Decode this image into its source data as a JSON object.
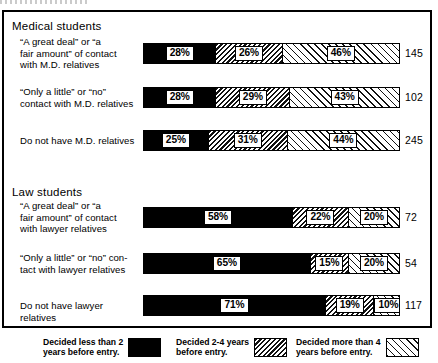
{
  "chart_data": {
    "type": "bar",
    "subtype": "stacked-horizontal-percent",
    "title": "",
    "xlabel": "",
    "ylabel": "",
    "xlim": [
      0,
      100
    ],
    "grid": false,
    "legend_position": "bottom",
    "series": [
      {
        "name": "Decided less than 2 years before entry.",
        "key": "s0",
        "pattern": "solid-black"
      },
      {
        "name": "Decided 2-4 years before entry.",
        "key": "s1",
        "pattern": "dense-diagonal-hatch"
      },
      {
        "name": "Decided more than 4 years before entry.",
        "key": "s2",
        "pattern": "sparse-diagonal-hatch"
      }
    ],
    "groups": [
      {
        "heading": "Medical students",
        "rows": [
          {
            "label": "“A great deal” or “a\nfair amount” of contact\nwith M.D. relatives",
            "values": [
              28,
              26,
              46
            ],
            "value_labels": [
              "28%",
              "26%",
              "46%"
            ],
            "total": "145"
          },
          {
            "label": "“Only a little” or “no”\ncontact with M.D. relatives",
            "values": [
              28,
              29,
              43
            ],
            "value_labels": [
              "28%",
              "29%",
              "43%"
            ],
            "total": "102"
          },
          {
            "label": "Do not have M.D. relatives",
            "values": [
              25,
              31,
              44
            ],
            "value_labels": [
              "25%",
              "31%",
              "44%"
            ],
            "total": "245"
          }
        ]
      },
      {
        "heading": "Law students",
        "rows": [
          {
            "label": "“A great deal” or “a\nfair amount” of contact\nwith lawyer relatives",
            "values": [
              58,
              22,
              20
            ],
            "value_labels": [
              "58%",
              "22%",
              "20%"
            ],
            "total": "72"
          },
          {
            "label": "“Only a little” or “no” con-\ntact with lawyer relatives",
            "values": [
              65,
              15,
              20
            ],
            "value_labels": [
              "65%",
              "15%",
              "20%"
            ],
            "total": "54"
          },
          {
            "label": "Do not have lawyer relatives",
            "values": [
              71,
              19,
              10
            ],
            "value_labels": [
              "71%",
              "19%",
              "10%"
            ],
            "total": "117"
          }
        ]
      }
    ],
    "legend": [
      {
        "text": "Decided less than 2\nyears before entry.",
        "swatch": "s0"
      },
      {
        "text": "Decided 2-4 years\nbefore entry.",
        "swatch": "s1"
      },
      {
        "text": "Decided more than 4\nyears before entry.",
        "swatch": "s2"
      }
    ]
  }
}
